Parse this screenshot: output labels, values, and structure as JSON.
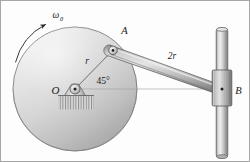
{
  "figure": {
    "background_color": "#fdfdfd",
    "border_color": "#9a9a9a",
    "labels": {
      "angular_velocity": "ω",
      "angular_velocity_subscript": "0",
      "center_point": "O",
      "pin_point": "A",
      "collar_point": "B",
      "disk_radius": "r",
      "link_length": "2r",
      "angle": "45°"
    },
    "geometry": {
      "disk_center": [
        75,
        89
      ],
      "disk_radius": 62,
      "point_A": [
        113,
        50
      ],
      "point_B": [
        222,
        89
      ],
      "angle_OA_degrees": 45,
      "shaft_x": 222,
      "shaft_top_y": 28,
      "shaft_bottom_y": 158
    },
    "colors": {
      "disk_light": "#e8e8e8",
      "disk_mid": "#c9c9c9",
      "disk_dark": "#a8a8a8",
      "outline": "#4a4a4a",
      "link_light": "#d8d8d8",
      "link_mid": "#a9a9a9",
      "link_dark": "#7e7e7e",
      "shaft_light": "#efefef",
      "shaft_mid": "#bdbdbd",
      "shaft_dark": "#8a8a8a",
      "hatch": "#707070",
      "text": "#1b1b1b"
    },
    "parts": [
      {
        "name": "rotating-disk",
        "label": "disk"
      },
      {
        "name": "center-hub",
        "label": "O"
      },
      {
        "name": "support-base",
        "label": "fixed support"
      },
      {
        "name": "connecting-link",
        "label": "2r"
      },
      {
        "name": "vertical-shaft",
        "label": "shaft"
      },
      {
        "name": "sliding-collar",
        "label": "B"
      }
    ]
  }
}
